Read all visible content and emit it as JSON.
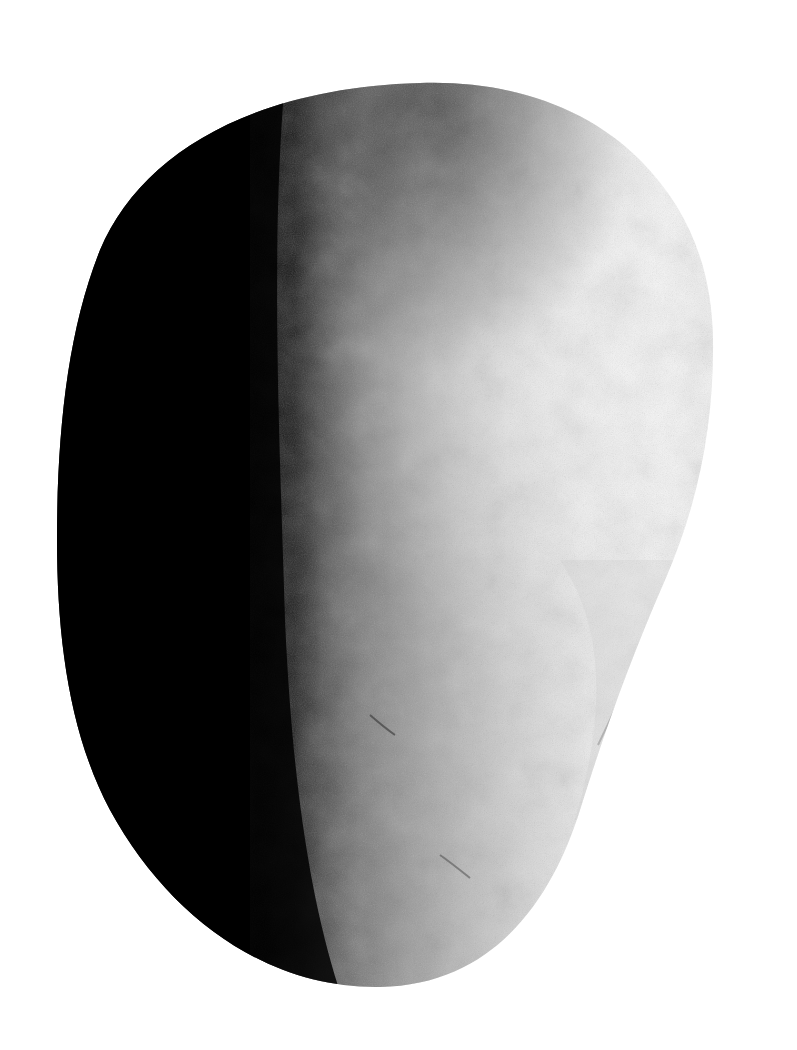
{
  "image": {
    "subject": "smooth stone",
    "style": "black-and-white photograph",
    "width": 797,
    "height": 1050
  },
  "colors": {
    "background": "#ffffff",
    "shadow": "#000000",
    "midtone": "#8a8a8a",
    "highlight": "#f4f4f4"
  }
}
